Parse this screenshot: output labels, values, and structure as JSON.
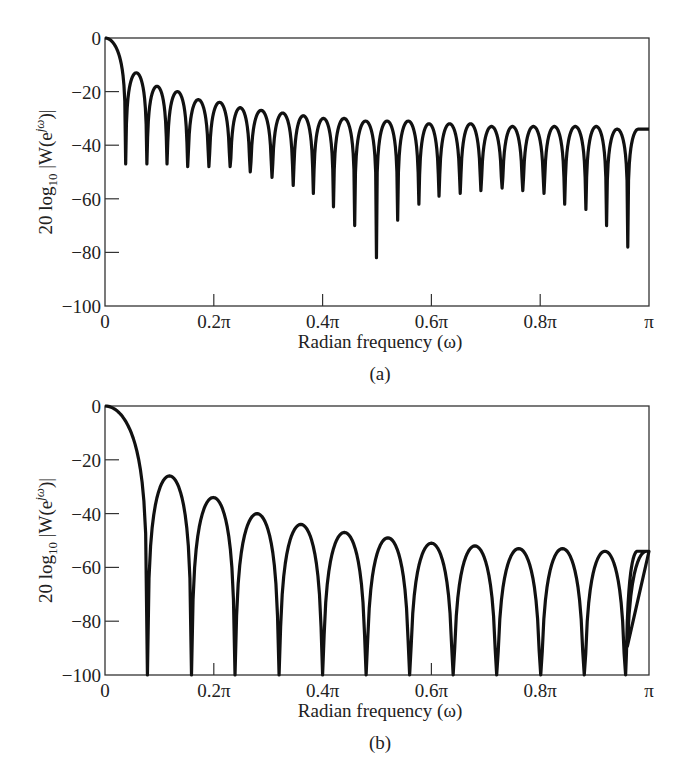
{
  "chart_data": [
    {
      "id": "a",
      "type": "line",
      "caption": "(a)",
      "title": "",
      "xlabel": "Radian frequency (ω)",
      "ylabel": "20 log10 |W(e^jω)|",
      "ylabel_parts": {
        "prefix": "20 log",
        "sub": "10",
        "mid": " |W(e",
        "sup": "jω",
        "suffix": ")|"
      },
      "xlim": [
        0,
        1
      ],
      "x_unit": "π",
      "ylim": [
        -100,
        0
      ],
      "xticks": [
        0,
        0.2,
        0.4,
        0.6,
        0.8,
        1.0
      ],
      "xtick_labels": [
        "0",
        "0.2π",
        "0.4π",
        "0.6π",
        "0.8π",
        "π"
      ],
      "yticks": [
        0,
        -20,
        -40,
        -60,
        -80,
        -100
      ],
      "ytick_labels": [
        "0",
        "−20",
        "−40",
        "−60",
        "−80",
        "−100"
      ],
      "grid": false,
      "legend": null,
      "description": "Log magnitude of Fourier transform of rectangular window; mainlobe at 0 dB, sidelobes decaying from about -13 dB toward about -33 dB, with deep nulls",
      "mainlobe_peak_db": 0,
      "nulls_x_pi": [
        0.038,
        0.077,
        0.114,
        0.152,
        0.191,
        0.23,
        0.267,
        0.307,
        0.346,
        0.383,
        0.42,
        0.459,
        0.499,
        0.538,
        0.577,
        0.614,
        0.653,
        0.691,
        0.73,
        0.768,
        0.807,
        0.845,
        0.884,
        0.922,
        0.961,
        1.0
      ],
      "nulls_db": [
        -47,
        -47,
        -47,
        -48,
        -48,
        -48,
        -50,
        -52,
        -55,
        -58,
        -63,
        -70,
        -82,
        -68,
        -62,
        -59,
        -58,
        -57,
        -56,
        -57,
        -58,
        -62,
        -64,
        -70,
        -78,
        -34
      ],
      "sidelobe_peaks_db": [
        -13,
        -18,
        -20,
        -23,
        -24,
        -26,
        -27,
        -28,
        -29,
        -30,
        -30,
        -31,
        -31,
        -31,
        -32,
        -32,
        -32,
        -33,
        -33,
        -33,
        -33,
        -33,
        -33,
        -34,
        -34
      ]
    },
    {
      "id": "b",
      "type": "line",
      "caption": "(b)",
      "title": "",
      "xlabel": "Radian frequency (ω)",
      "ylabel": "20 log10 |W(e^jω)|",
      "ylabel_parts": {
        "prefix": "20 log",
        "sub": "10",
        "mid": " |W(e",
        "sup": "jω",
        "suffix": ")|"
      },
      "xlim": [
        0,
        1
      ],
      "x_unit": "π",
      "ylim": [
        -100,
        0
      ],
      "xticks": [
        0,
        0.2,
        0.4,
        0.6,
        0.8,
        1.0
      ],
      "xtick_labels": [
        "0",
        "0.2π",
        "0.4π",
        "0.6π",
        "0.8π",
        "π"
      ],
      "yticks": [
        0,
        -20,
        -40,
        -60,
        -80,
        -100
      ],
      "ytick_labels": [
        "0",
        "−20",
        "−40",
        "−60",
        "−80",
        "−100"
      ],
      "grid": false,
      "legend": null,
      "description": "Log magnitude of Fourier transform of Bartlett (triangular) window; wider mainlobe, sidelobes from about -26 dB decaying toward about -54 dB, nulls reaching -100 dB",
      "mainlobe_peak_db": 0,
      "nulls_x_pi": [
        0.078,
        0.159,
        0.239,
        0.32,
        0.4,
        0.48,
        0.56,
        0.64,
        0.72,
        0.801,
        0.881,
        0.957
      ],
      "nulls_db": [
        -100,
        -100,
        -100,
        -100,
        -100,
        -100,
        -100,
        -100,
        -100,
        -100,
        -100,
        -100
      ],
      "sidelobe_peaks_db": [
        -26,
        -34,
        -40,
        -44,
        -47,
        -49,
        -51,
        -52,
        -53,
        -53,
        -54,
        -54
      ]
    }
  ],
  "panels": {
    "a": {
      "caption": "(a)",
      "xlabel": "Radian frequency (ω)"
    },
    "b": {
      "caption": "(b)",
      "xlabel": "Radian frequency (ω)"
    }
  }
}
